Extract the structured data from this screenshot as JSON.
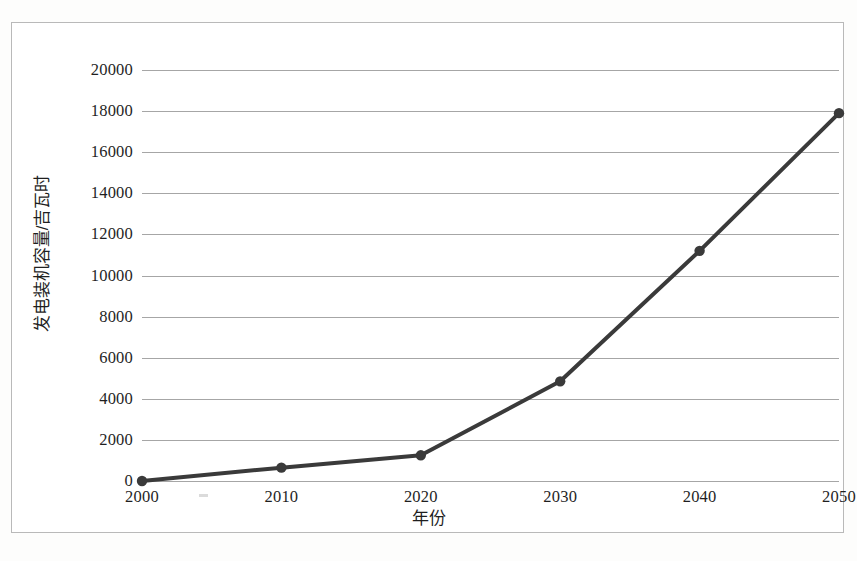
{
  "figure": {
    "background_color": "#fdfdfc",
    "frame_border_color": "#b9b9b9",
    "gridline_color": "#a6a6a6",
    "series_color": "#3a3a3a"
  },
  "chart_data": {
    "type": "line",
    "title": "",
    "subtitle": "",
    "xlabel": "年份",
    "ylabel": "发电装机容量/吉瓦时",
    "x": [
      2000,
      2010,
      2020,
      2030,
      2040,
      2050
    ],
    "categories": [
      "2000",
      "2010",
      "2020",
      "2030",
      "2040",
      "2050"
    ],
    "values": [
      0,
      650,
      1250,
      4850,
      11200,
      17900
    ],
    "series": [
      {
        "name": "发电装机容量",
        "values": [
          0,
          650,
          1250,
          4850,
          11200,
          17900
        ],
        "color": "#3a3a3a",
        "marker": "circle",
        "line_width": 4
      }
    ],
    "xlim": [
      2000,
      2050
    ],
    "ylim": [
      0,
      20000
    ],
    "ytick_step": 2000,
    "yticks": [
      0,
      2000,
      4000,
      6000,
      8000,
      10000,
      12000,
      14000,
      16000,
      18000,
      20000
    ],
    "ytick_labels": [
      "0",
      "2000",
      "4000",
      "6000",
      "8000",
      "10000",
      "12000",
      "14000",
      "16000",
      "18000",
      "20000"
    ],
    "xticks": [
      2000,
      2010,
      2020,
      2030,
      2040,
      2050
    ],
    "xtick_labels": [
      "2000",
      "2010",
      "2020",
      "2030",
      "2040",
      "2050"
    ],
    "grid": {
      "horizontal": true,
      "vertical": false
    },
    "legend": {
      "visible": false,
      "position": "none"
    },
    "annotations": []
  }
}
